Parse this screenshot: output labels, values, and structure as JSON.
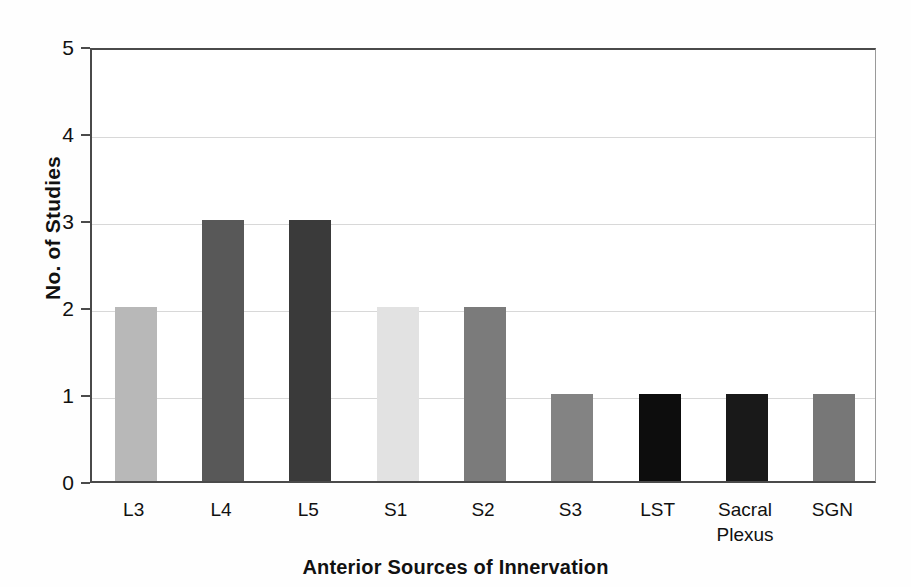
{
  "chart_data": {
    "type": "bar",
    "title": "",
    "xlabel": "Anterior Sources of Innervation",
    "ylabel": "No. of Studies",
    "categories": [
      "L3",
      "L4",
      "L5",
      "S1",
      "S2",
      "S3",
      "LST",
      "Sacral Plexus",
      "SGN"
    ],
    "category_lines": [
      [
        "L3"
      ],
      [
        "L4"
      ],
      [
        "L5"
      ],
      [
        "S1"
      ],
      [
        "S2"
      ],
      [
        "S3"
      ],
      [
        "LST"
      ],
      [
        "Sacral",
        "Plexus"
      ],
      [
        "SGN"
      ]
    ],
    "values": [
      2,
      3,
      3,
      2,
      2,
      1,
      1,
      1,
      1
    ],
    "bar_colors": [
      "#b8b8b8",
      "#585858",
      "#3a3a3a",
      "#e2e2e2",
      "#7b7b7b",
      "#838383",
      "#0d0d0d",
      "#191919",
      "#777777"
    ],
    "ylim": [
      0,
      5
    ],
    "ytick_labels": [
      "5",
      "4",
      "3",
      "2",
      "1",
      "0"
    ],
    "ytick_values": [
      5,
      4,
      3,
      2,
      1,
      0
    ],
    "grid": true,
    "grid_axis": "y",
    "legend": "none",
    "axis_color": "#4a4a4a",
    "grid_color": "#d8d8d8",
    "background": "#ffffff"
  }
}
